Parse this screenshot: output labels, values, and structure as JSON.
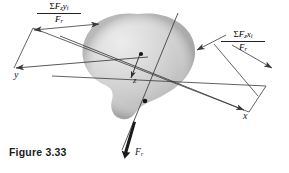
{
  "figure": {
    "caption": "Figure 3.33",
    "background_color": "#ffffff",
    "line_color": "#3a3a3a",
    "text_color": "#171717",
    "blob_light_color": "#e9e9e9",
    "blob_mid_color": "#c9c9c9",
    "blob_dark_color": "#9a9a9a"
  },
  "axes": [
    {
      "name": "y-axis",
      "label": "y"
    },
    {
      "name": "x-axis",
      "label": "x"
    },
    {
      "name": "z-axis",
      "label": "z"
    }
  ],
  "dimensions": [
    {
      "name": "y-centroid-dimension",
      "sigma": "Σ",
      "numerator_force": "F",
      "numerator_force_sub": "z",
      "numerator_coord": "y",
      "numerator_coord_sub": "i",
      "denominator_force": "F",
      "denominator_sub": "r",
      "numerator_text": "ΣF",
      "full_text": "ΣF₂yᵢ / Fᵣ"
    },
    {
      "name": "x-centroid-dimension",
      "sigma": "Σ",
      "numerator_force": "F",
      "numerator_force_sub": "z",
      "numerator_coord": "x",
      "numerator_coord_sub": "i",
      "denominator_force": "F",
      "denominator_sub": "r",
      "numerator_text": "ΣF",
      "full_text": "ΣF₂xᵢ / Fᵣ"
    }
  ],
  "force": {
    "name": "resultant-force",
    "label": "F",
    "label_sub": "r"
  }
}
